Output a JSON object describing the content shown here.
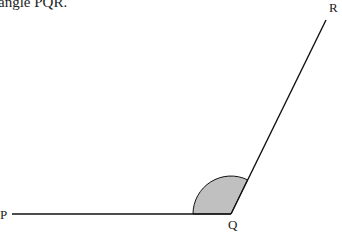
{
  "caption": "angle PQR.",
  "diagram": {
    "points": {
      "P": {
        "label": "P"
      },
      "Q": {
        "label": "Q"
      },
      "R": {
        "label": "R"
      }
    },
    "shaded_angle": "PQR",
    "colors": {
      "line": "#111111",
      "shade": "#c0c0c0"
    }
  }
}
